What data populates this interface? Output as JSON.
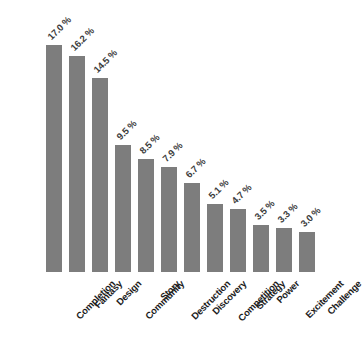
{
  "chart_data": {
    "type": "bar",
    "title": "",
    "xlabel": "",
    "ylabel": "",
    "ylim": [
      0,
      18
    ],
    "grid": false,
    "legend": null,
    "orientation": "vertical",
    "bar_color": "#7d7d7d",
    "background_color": "#ffffff",
    "label_rotation": -45,
    "categories": [
      "Completion",
      "Fantasy",
      "Design",
      "Community",
      "Story",
      "Destruction",
      "Discovery",
      "Competition",
      "Strategy",
      "Power",
      "Excitement",
      "Challenge"
    ],
    "values": [
      17.0,
      16.2,
      14.5,
      9.5,
      8.5,
      7.9,
      6.7,
      5.1,
      4.7,
      3.5,
      3.3,
      3.0
    ],
    "value_labels": [
      "17.0 %",
      "16.2 %",
      "14.5 %",
      "9.5 %",
      "8.5 %",
      "7.9 %",
      "6.7 %",
      "5.1 %",
      "4.7 %",
      "3.5 %",
      "3.3 %",
      "3.0 %"
    ],
    "bars": [
      {
        "category": "Completion",
        "value": 17.0,
        "label": "17.0 %"
      },
      {
        "category": "Fantasy",
        "value": 16.2,
        "label": "16.2 %"
      },
      {
        "category": "Design",
        "value": 14.5,
        "label": "14.5 %"
      },
      {
        "category": "Community",
        "value": 9.5,
        "label": "9.5 %"
      },
      {
        "category": "Story",
        "value": 8.5,
        "label": "8.5 %"
      },
      {
        "category": "Destruction",
        "value": 7.9,
        "label": "7.9 %"
      },
      {
        "category": "Discovery",
        "value": 6.7,
        "label": "6.7 %"
      },
      {
        "category": "Competition",
        "value": 5.1,
        "label": "5.1 %"
      },
      {
        "category": "Strategy",
        "value": 4.7,
        "label": "4.7 %"
      },
      {
        "category": "Power",
        "value": 3.5,
        "label": "3.5 %"
      },
      {
        "category": "Excitement",
        "value": 3.3,
        "label": "3.3 %"
      },
      {
        "category": "Challenge",
        "value": 3.0,
        "label": "3.0 %"
      }
    ]
  },
  "layout": {
    "baseline_y": 272,
    "first_bar_left": 46,
    "bar_width": 16,
    "bar_pitch": 23,
    "px_per_unit": 13.35
  }
}
